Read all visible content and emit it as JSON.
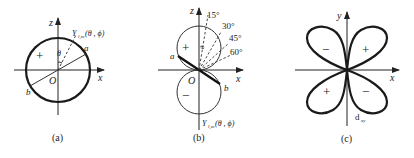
{
  "panels": [
    {
      "id": "a",
      "caption": "(a)",
      "axes": {
        "vertical": "z",
        "horizontal": "x",
        "origin": "O"
      },
      "function_label": "Y",
      "function_sub": "l,m",
      "function_args": "(θ , ϕ)",
      "angle_label": "θ",
      "point_labels": {
        "a": "a",
        "b": "b"
      },
      "sign_labels": [
        "+"
      ]
    },
    {
      "id": "b",
      "caption": "(b)",
      "axes": {
        "vertical": "z",
        "horizontal": "x",
        "origin": "O"
      },
      "function_label": "Y",
      "function_sub": "l,m",
      "function_args": "(θ , ϕ)",
      "angle_label": "θ",
      "angle_ticks": [
        "15°",
        "30°",
        "45°",
        "60°"
      ],
      "point_labels": {
        "a": "a",
        "b": "b"
      },
      "sign_labels": [
        "+",
        "−"
      ]
    },
    {
      "id": "c",
      "caption": "(c)",
      "axes": {
        "vertical": "y",
        "horizontal": "x"
      },
      "orbital_label": "d",
      "orbital_sub": "xy",
      "sign_labels": {
        "upper_left": "−",
        "upper_right": "+",
        "lower_left": "+",
        "lower_right": "−"
      }
    }
  ]
}
